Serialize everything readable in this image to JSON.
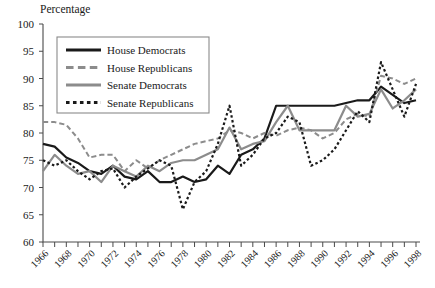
{
  "chart_data": {
    "type": "line",
    "title": "",
    "ylabel": "Percentage",
    "xlabel": "",
    "ylim": [
      60,
      100
    ],
    "xlim": [
      1966,
      1999
    ],
    "ytick_step": 5,
    "yticks": [
      60,
      65,
      70,
      75,
      80,
      85,
      90,
      95,
      100
    ],
    "grid": false,
    "legend_position": "top-left",
    "x": [
      1966,
      1967,
      1968,
      1969,
      1970,
      1971,
      1972,
      1973,
      1974,
      1975,
      1976,
      1977,
      1978,
      1979,
      1980,
      1981,
      1982,
      1983,
      1984,
      1985,
      1986,
      1987,
      1988,
      1989,
      1990,
      1991,
      1992,
      1993,
      1994,
      1995,
      1996,
      1997,
      1998
    ],
    "xtick_labels": [
      "1966",
      "1968",
      "1970",
      "1972",
      "1974",
      "1976",
      "1978",
      "1980",
      "1982",
      "1984",
      "1986",
      "1988",
      "1990",
      "1992",
      "1994",
      "1996",
      "1998"
    ],
    "series": [
      {
        "name": "House Democrats",
        "color": "#1a1a1a",
        "style": "solid",
        "width": 2.2,
        "values": [
          78,
          77.5,
          75.5,
          74.5,
          73,
          72.5,
          74,
          72,
          71.5,
          73,
          71,
          71,
          72,
          71,
          71.5,
          74,
          72.5,
          76,
          77,
          79,
          85,
          85,
          85,
          85,
          85,
          85,
          85.5,
          86,
          86,
          88.5,
          87,
          85.5,
          86
        ]
      },
      {
        "name": "House Republicans",
        "color": "#8c8c8c",
        "style": "dashed",
        "width": 2.0,
        "values": [
          82,
          82,
          81.5,
          79,
          75.5,
          76,
          76,
          73,
          75,
          73.5,
          75,
          76,
          77,
          78,
          78.5,
          79,
          80.5,
          80,
          79,
          80,
          79.5,
          80.5,
          81,
          80.5,
          79,
          80,
          82.5,
          83.5,
          83,
          90.5,
          90,
          89,
          90
        ]
      },
      {
        "name": "Senate Democrats",
        "color": "#8c8c8c",
        "style": "solid",
        "width": 2.2,
        "values": [
          73,
          76,
          74,
          72.5,
          73,
          71,
          74,
          73,
          72,
          74,
          73,
          74.5,
          75,
          75,
          76,
          77,
          81,
          77,
          78,
          78.5,
          82,
          85,
          80.5,
          80.5,
          80.5,
          80.5,
          85,
          83,
          83.5,
          88,
          84.5,
          86,
          88
        ]
      },
      {
        "name": "Senate Republicans",
        "color": "#1a1a1a",
        "style": "dotted",
        "width": 2.2,
        "values": [
          75,
          74,
          75,
          73,
          71.5,
          73,
          73.5,
          70,
          72,
          73.5,
          75,
          74,
          66,
          71,
          73,
          78,
          85,
          74,
          76,
          79,
          80,
          83,
          82,
          74,
          75,
          77,
          80.5,
          84,
          82,
          93,
          88,
          83,
          89
        ]
      }
    ]
  },
  "legend": {
    "entries": [
      {
        "label": "House Democrats"
      },
      {
        "label": "House Republicans"
      },
      {
        "label": "Senate Democrats"
      },
      {
        "label": "Senate Republicans"
      }
    ]
  }
}
